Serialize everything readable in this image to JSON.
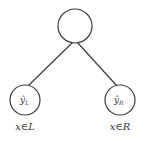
{
  "diagram": {
    "type": "decision-tree-split",
    "root": {
      "label": ""
    },
    "leaves": [
      {
        "label_base": "ŷ",
        "label_sub": "L",
        "condition": "x∈L"
      },
      {
        "label_base": "ŷ",
        "label_sub": "R",
        "condition": "x∈R"
      }
    ],
    "colors": {
      "stroke": "#3a3a3a",
      "background": "#ffffff",
      "text": "#333333"
    }
  }
}
